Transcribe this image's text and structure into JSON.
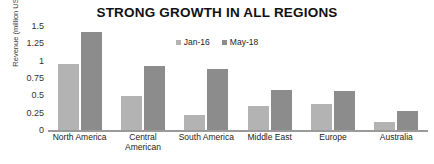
{
  "chart_data": {
    "type": "bar",
    "title": "STRONG GROWTH IN ALL REGIONS",
    "xlabel": "",
    "ylabel": "Revenue (million USD)",
    "ylim": [
      0,
      1.5
    ],
    "grid": false,
    "legend_position": "top-center",
    "categories": [
      "North America",
      "Central American",
      "South America",
      "Middle East",
      "Europe",
      "Australia"
    ],
    "category_lines": [
      [
        "North America"
      ],
      [
        "Central",
        "American"
      ],
      [
        "South America"
      ],
      [
        "Middle East"
      ],
      [
        "Europe"
      ],
      [
        "Australia"
      ]
    ],
    "ytick_labels": [
      "1.5",
      "1.25",
      "1",
      "0.75",
      "0.5",
      "0.25",
      "0"
    ],
    "ytick_values": [
      1.5,
      1.25,
      1,
      0.75,
      0.5,
      0.25,
      0
    ],
    "series": [
      {
        "name": "Jan-16",
        "color": "#b3b3b3",
        "values": [
          0.95,
          0.49,
          0.22,
          0.34,
          0.38,
          0.12
        ]
      },
      {
        "name": "May-18",
        "color": "#8c8c8c",
        "values": [
          1.42,
          0.92,
          0.88,
          0.57,
          0.56,
          0.28
        ]
      }
    ]
  }
}
